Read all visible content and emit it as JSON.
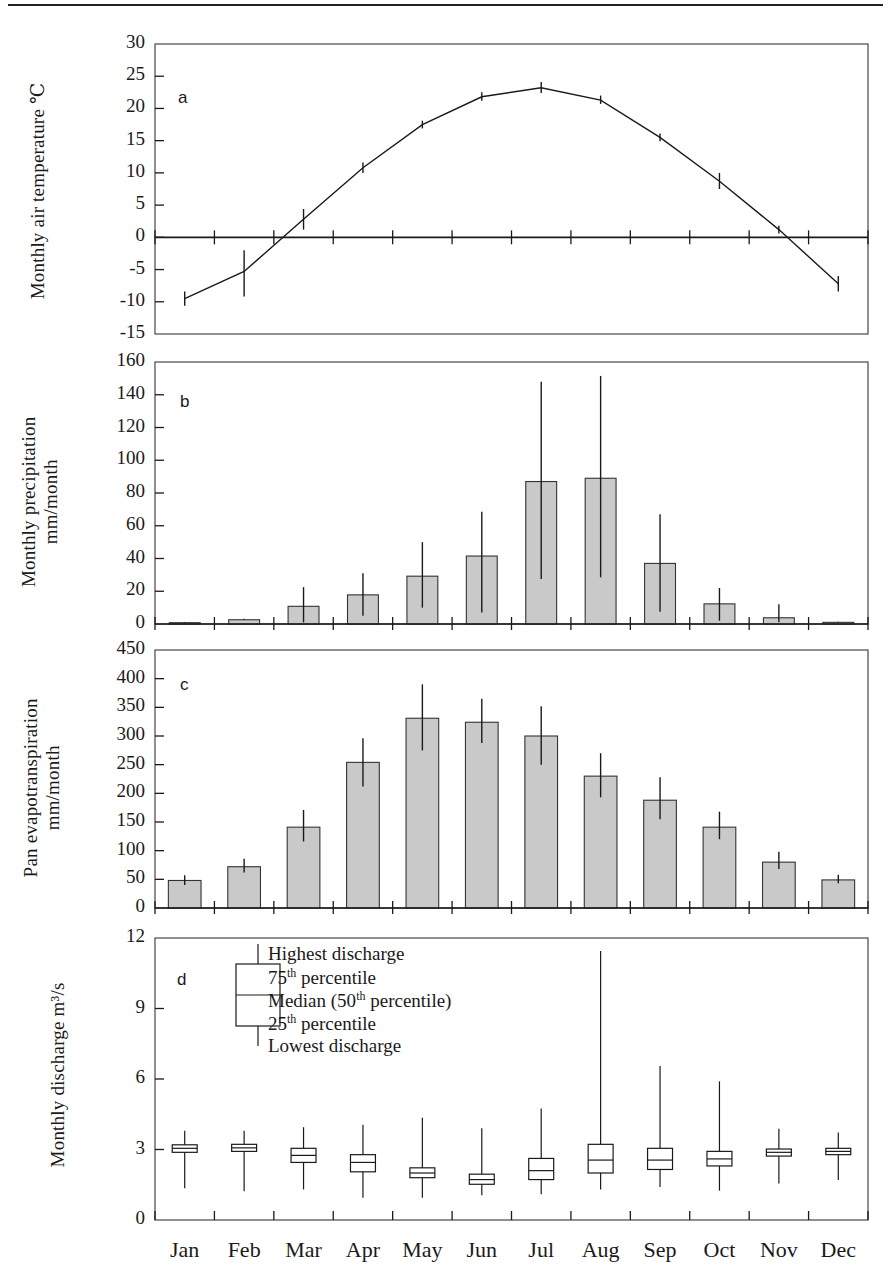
{
  "figure": {
    "months": [
      "Jan",
      "Feb",
      "Mar",
      "Apr",
      "May",
      "Jun",
      "Jul",
      "Aug",
      "Sep",
      "Oct",
      "Nov",
      "Dec"
    ],
    "panel_letters": {
      "a": "a",
      "b": "b",
      "c": "c",
      "d": "d"
    }
  },
  "axis_titles": {
    "a": "Monthly air temperature ℃",
    "b_line1": "Monthly precipitation",
    "b_line2": "mm/month",
    "c_line1": "Pan evapotranspiration",
    "c_line2": "mm/month",
    "d": "Monthly discharge m³/s"
  },
  "legend": {
    "highest": "Highest discharge",
    "p75_num": "75",
    "p75_sup": "th",
    "p75_rest": " percentile",
    "median_pre": "Median (50",
    "median_sup": "th",
    "median_rest": " percentile)",
    "p25_num": "25",
    "p25_sup": "th",
    "p25_rest": " percentile",
    "lowest": "Lowest discharge"
  },
  "chart_data": [
    {
      "type": "line",
      "panel": "a",
      "title": "",
      "xlabel": "",
      "ylabel": "Monthly air temperature ℃",
      "categories": [
        "Jan",
        "Feb",
        "Mar",
        "Apr",
        "May",
        "Jun",
        "Jul",
        "Aug",
        "Sep",
        "Oct",
        "Nov",
        "Dec"
      ],
      "values": [
        -9.5,
        -5.3,
        2.8,
        10.8,
        17.5,
        21.8,
        23.2,
        21.3,
        15.5,
        8.7,
        1.2,
        -7.2
      ],
      "error_low": [
        -10.6,
        -9.2,
        1.2,
        10.0,
        16.9,
        21.2,
        22.4,
        20.7,
        14.9,
        7.5,
        0.6,
        -8.4
      ],
      "error_high": [
        -8.4,
        -2.0,
        4.4,
        11.6,
        18.1,
        22.5,
        24.1,
        22.0,
        16.1,
        10.0,
        1.8,
        -6.0
      ],
      "ylim": [
        -15,
        30
      ],
      "yticks": [
        -15,
        -10,
        -5,
        0,
        5,
        10,
        15,
        20,
        25,
        30
      ],
      "grid": false,
      "legend": "none",
      "error_type": "range"
    },
    {
      "type": "bar",
      "panel": "b",
      "title": "",
      "xlabel": "",
      "ylabel": "Monthly precipitation mm/month",
      "categories": [
        "Jan",
        "Feb",
        "Mar",
        "Apr",
        "May",
        "Jun",
        "Jul",
        "Aug",
        "Sep",
        "Oct",
        "Nov",
        "Dec"
      ],
      "values": [
        0.8,
        2.6,
        10.8,
        17.8,
        29.2,
        41.5,
        87.0,
        89.0,
        37.0,
        12.3,
        3.8,
        1.0
      ],
      "error_low": [
        0.8,
        2.6,
        1.0,
        5.0,
        10.0,
        7.0,
        27.5,
        28.5,
        7.5,
        2.0,
        1.0,
        1.0
      ],
      "error_high": [
        1.2,
        3.2,
        22.5,
        31.0,
        50.0,
        68.5,
        148.0,
        151.5,
        67.0,
        22.0,
        12.0,
        1.4
      ],
      "ylim": [
        0,
        160
      ],
      "yticks": [
        0,
        20,
        40,
        60,
        80,
        100,
        120,
        140,
        160
      ],
      "grid": false,
      "legend": "none",
      "error_type": "range"
    },
    {
      "type": "bar",
      "panel": "c",
      "title": "",
      "xlabel": "",
      "ylabel": "Pan evapotranspiration mm/month",
      "categories": [
        "Jan",
        "Feb",
        "Mar",
        "Apr",
        "May",
        "Jun",
        "Jul",
        "Aug",
        "Sep",
        "Oct",
        "Nov",
        "Dec"
      ],
      "values": [
        48,
        72,
        141,
        254,
        331,
        324,
        300,
        230,
        188,
        141,
        80,
        49
      ],
      "error_low": [
        40,
        62,
        116,
        212,
        275,
        288,
        250,
        193,
        155,
        120,
        68,
        43
      ],
      "error_high": [
        57,
        86,
        171,
        296,
        390,
        365,
        352,
        270,
        228,
        168,
        98,
        58
      ],
      "ylim": [
        0,
        450
      ],
      "yticks": [
        0,
        50,
        100,
        150,
        200,
        250,
        300,
        350,
        400,
        450
      ],
      "grid": false,
      "legend": "none",
      "error_type": "range"
    },
    {
      "type": "boxplot",
      "panel": "d",
      "title": "",
      "xlabel": "",
      "ylabel": "Monthly discharge m³/s",
      "categories": [
        "Jan",
        "Feb",
        "Mar",
        "Apr",
        "May",
        "Jun",
        "Jul",
        "Aug",
        "Sep",
        "Oct",
        "Nov",
        "Dec"
      ],
      "ylim": [
        0,
        12
      ],
      "yticks": [
        0,
        3,
        6,
        9,
        12
      ],
      "grid": false,
      "legend": "inside-top-left",
      "boxes": [
        {
          "month": "Jan",
          "low": 1.35,
          "q25": 2.88,
          "median": 3.05,
          "q75": 3.2,
          "high": 3.8
        },
        {
          "month": "Feb",
          "low": 1.22,
          "q25": 2.92,
          "median": 3.07,
          "q75": 3.22,
          "high": 3.8
        },
        {
          "month": "Mar",
          "low": 1.3,
          "q25": 2.45,
          "median": 2.75,
          "q75": 3.05,
          "high": 3.95
        },
        {
          "month": "Apr",
          "low": 0.95,
          "q25": 2.05,
          "median": 2.45,
          "q75": 2.78,
          "high": 4.05
        },
        {
          "month": "May",
          "low": 0.95,
          "q25": 1.8,
          "median": 2.0,
          "q75": 2.22,
          "high": 4.35
        },
        {
          "month": "Jun",
          "low": 1.05,
          "q25": 1.52,
          "median": 1.72,
          "q75": 1.95,
          "high": 3.9
        },
        {
          "month": "Jul",
          "low": 1.1,
          "q25": 1.72,
          "median": 2.1,
          "q75": 2.62,
          "high": 4.75
        },
        {
          "month": "Aug",
          "low": 1.3,
          "q25": 2.0,
          "median": 2.55,
          "q75": 3.22,
          "high": 11.45
        },
        {
          "month": "Sep",
          "low": 1.4,
          "q25": 2.15,
          "median": 2.55,
          "q75": 3.05,
          "high": 6.55
        },
        {
          "month": "Oct",
          "low": 1.25,
          "q25": 2.3,
          "median": 2.6,
          "q75": 2.92,
          "high": 5.9
        },
        {
          "month": "Nov",
          "low": 1.55,
          "q25": 2.72,
          "median": 2.88,
          "q75": 3.02,
          "high": 3.88
        },
        {
          "month": "Dec",
          "low": 1.7,
          "q25": 2.78,
          "median": 2.92,
          "q75": 3.05,
          "high": 3.72
        }
      ]
    }
  ],
  "colors": {
    "bar_fill": "#c9c9c9",
    "line": "#1a1a1a",
    "frame": "#555555",
    "text": "#1a1a1a"
  }
}
